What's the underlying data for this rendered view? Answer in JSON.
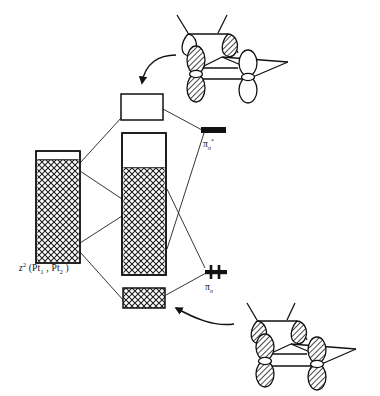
{
  "figure": {
    "type": "molecular-orbital-band-interaction-diagram",
    "background_color": "#ffffff",
    "line_color": "#111111",
    "hatch_color": "#1a1a1a",
    "fill_white": "#ffffff",
    "width": 380,
    "height": 396
  },
  "labels": {
    "left_band_label_prefix": "z",
    "left_band_label_sup": "2",
    "left_band_label_body": " (Pt",
    "left_band_label_sub1": "1",
    "left_band_label_mid": " , Pt",
    "left_band_label_sub2": "2",
    "left_band_label_close": " )",
    "pi_star_symbol": "π",
    "pi_star_sub": "σ",
    "pi_star_sup": "*",
    "pi_symbol": "π",
    "pi_sub": "σ"
  },
  "bands": [
    {
      "name": "left-band-z2",
      "x": 36,
      "y": 151,
      "w": 44,
      "h": 112,
      "empty_top_fraction": 0.075,
      "fill": "crosshatch",
      "description": "z2 (Pt1, Pt2) band, nearly fully occupied"
    },
    {
      "name": "center-upper-box",
      "x": 121,
      "y": 94,
      "w": 42,
      "h": 26,
      "empty_top_fraction": 1.0,
      "fill": "empty",
      "description": "empty antibonding band block"
    },
    {
      "name": "center-main-band",
      "x": 122,
      "y": 133,
      "w": 44,
      "h": 142,
      "empty_top_fraction": 0.245,
      "fill": "crosshatch",
      "description": "main hybridized band, partially filled"
    },
    {
      "name": "center-lower-band",
      "x": 123,
      "y": 288,
      "w": 42,
      "h": 20,
      "empty_top_fraction": 0.0,
      "fill": "crosshatch",
      "description": "fully occupied bonding band"
    }
  ],
  "levels": [
    {
      "name": "pi-sigma-star-level",
      "x": 201,
      "y": 127,
      "w": 25,
      "h": 6,
      "electrons": 0,
      "description": "pi-sigma* empty level, solid black bar"
    },
    {
      "name": "pi-sigma-level",
      "x": 205,
      "y": 269,
      "w": 22,
      "h": 5,
      "electrons": 2,
      "description": "pi-sigma filled level with electron pair"
    }
  ],
  "correlation_lines": [
    {
      "name": "left-band-top-to-upper-box",
      "x1": 80,
      "y1": 163,
      "x2": 121,
      "y2": 118
    },
    {
      "name": "left-band-top-to-main-band",
      "x1": 80,
      "y1": 171,
      "x2": 166,
      "y2": 228
    },
    {
      "name": "left-band-bottom-to-main-band",
      "x1": 80,
      "y1": 242,
      "x2": 122,
      "y2": 216
    },
    {
      "name": "left-band-bottom-to-lower-band",
      "x1": 80,
      "y1": 252,
      "x2": 123,
      "y2": 300
    },
    {
      "name": "upper-box-to-pi-star",
      "x1": 163,
      "y1": 109,
      "x2": 201,
      "y2": 130
    },
    {
      "name": "main-band-to-pi-star",
      "x1": 166,
      "y1": 248,
      "x2": 203,
      "y2": 133
    },
    {
      "name": "main-band-to-pi",
      "x1": 166,
      "y1": 188,
      "x2": 205,
      "y2": 268
    },
    {
      "name": "lower-band-to-pi",
      "x1": 165,
      "y1": 294,
      "x2": 205,
      "y2": 273
    }
  ],
  "arrows": [
    {
      "name": "top-curved-arrow",
      "description": "curved arrow from upper-right pi-sigma* orbital drawing to upper box",
      "path": "M 175 56 C 160 56, 146 62, 143 84",
      "tip": "142,92"
    },
    {
      "name": "bottom-curved-arrow",
      "description": "curved arrow from lower-right pi-sigma orbital drawing to lower band",
      "path": "M 232 323 C 215 326, 196 320, 178 310",
      "tip": "170,306"
    }
  ],
  "orbital_drawings": [
    {
      "name": "pi-sigma-star-orbital",
      "position": "top-right",
      "bbox": {
        "x": 178,
        "y": 12,
        "w": 150,
        "h": 90
      },
      "lobes": [
        {
          "id": "front-left-upper",
          "shading": "white"
        },
        {
          "id": "front-right-upper",
          "shading": "hatched"
        },
        {
          "id": "left-pz-top",
          "shading": "hatched"
        },
        {
          "id": "left-pz-bottom",
          "shading": "hatched"
        },
        {
          "id": "right-pz-top",
          "shading": "white"
        },
        {
          "id": "right-pz-bottom",
          "shading": "white"
        }
      ],
      "description": "antibonding pi-sigma* combination, mixed phase lobes"
    },
    {
      "name": "pi-sigma-orbital",
      "position": "bottom-right",
      "bbox": {
        "x": 234,
        "y": 300,
        "w": 144,
        "h": 92
      },
      "lobes": [
        {
          "id": "front-left-upper",
          "shading": "hatched"
        },
        {
          "id": "front-right-upper",
          "shading": "hatched"
        },
        {
          "id": "left-pz-top",
          "shading": "hatched"
        },
        {
          "id": "left-pz-bottom",
          "shading": "hatched"
        },
        {
          "id": "right-pz-top",
          "shading": "hatched"
        },
        {
          "id": "right-pz-bottom",
          "shading": "hatched"
        }
      ],
      "description": "bonding pi-sigma combination, all lobes in phase"
    }
  ]
}
